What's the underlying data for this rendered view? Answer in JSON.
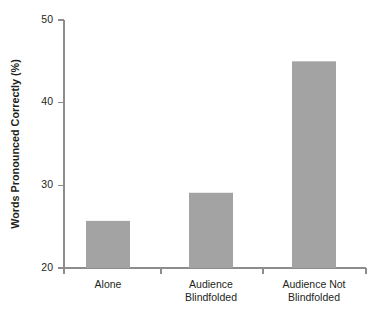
{
  "chart_data": {
    "type": "bar",
    "title": "",
    "subtitle": "",
    "xlabel": "",
    "ylabel": "Words Pronounced Correctly (%)",
    "categories": [
      "Alone",
      "Audience Blindfolded",
      "Audience Not Blindfolded"
    ],
    "category_lines": [
      [
        "Alone"
      ],
      [
        "Audience",
        "Blindfolded"
      ],
      [
        "Audience Not",
        "Blindfolded"
      ]
    ],
    "values": [
      25.7,
      29.1,
      45.0
    ],
    "ylim": [
      20,
      50
    ],
    "yticks": [
      20,
      30,
      40,
      50
    ],
    "ytick_labels": [
      "20",
      "30",
      "40",
      "50"
    ],
    "grid": false,
    "legend": false,
    "legend_position": "none",
    "bar_color": "#a3a3a3",
    "axis_color": "#8d8d8d",
    "text_color": "#231f20",
    "background_color": "#ffffff"
  },
  "figure": {
    "plot_left": 64,
    "plot_right": 366,
    "plot_top": 20,
    "plot_bottom": 268,
    "bar_width": 44,
    "xtick_positions": [
      64,
      161,
      263,
      366
    ],
    "bar_centers": [
      108,
      211,
      314
    ]
  }
}
